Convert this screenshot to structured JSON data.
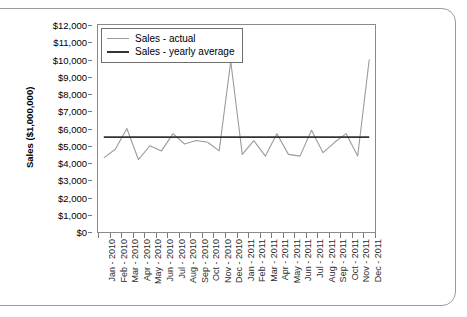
{
  "chart_data": {
    "type": "line",
    "title": "",
    "xlabel": "",
    "ylabel": "Sales ($1,000,000)",
    "ylim": [
      0,
      12000
    ],
    "ytick_step": 1000,
    "grid": false,
    "legend_position": "top-left",
    "y_tick_labels": [
      "$12,000",
      "$11,000",
      "$10,000",
      "$9,000",
      "$8,000",
      "$7,000",
      "$6,000",
      "$5,000",
      "$4,000",
      "$3,000",
      "$2,000",
      "$1,000",
      "$0"
    ],
    "y_tick_values": [
      12000,
      11000,
      10000,
      9000,
      8000,
      7000,
      6000,
      5000,
      4000,
      3000,
      2000,
      1000,
      0
    ],
    "categories": [
      "Jan - 2010",
      "Feb - 2010",
      "Mar - 2010",
      "Apr - 2010",
      "May - 2010",
      "Jun - 2010",
      "Jul - 2010",
      "Aug - 2010",
      "Sep - 2010",
      "Oct - 2010",
      "Nov - 2010",
      "Dec - 2010",
      "Jan - 2011",
      "Feb - 2011",
      "Mar - 2011",
      "Apr - 2011",
      "May - 2011",
      "Jun - 2011",
      "Jul - 2011",
      "Aug - 2011",
      "Sep - 2011",
      "Oct - 2011",
      "Nov - 2011",
      "Dec - 2011"
    ],
    "series": [
      {
        "name": "Sales - actual",
        "color": "#9b9b9b",
        "values": [
          4300,
          4800,
          6000,
          4200,
          5000,
          4700,
          5700,
          5100,
          5300,
          5200,
          4700,
          9900,
          4500,
          5300,
          4400,
          5700,
          4500,
          4400,
          5900,
          4600,
          5200,
          5700,
          4400,
          10000
        ]
      },
      {
        "name": "Sales - yearly average",
        "color": "#333333",
        "values": [
          5500,
          5500,
          5500,
          5500,
          5500,
          5500,
          5500,
          5500,
          5500,
          5500,
          5500,
          5500,
          5500,
          5500,
          5500,
          5500,
          5500,
          5500,
          5500,
          5500,
          5500,
          5500,
          5500,
          5500
        ]
      }
    ],
    "legend": [
      {
        "label": "Sales - actual",
        "color": "#9b9b9b"
      },
      {
        "label": "Sales - yearly average",
        "color": "#333333"
      }
    ]
  }
}
